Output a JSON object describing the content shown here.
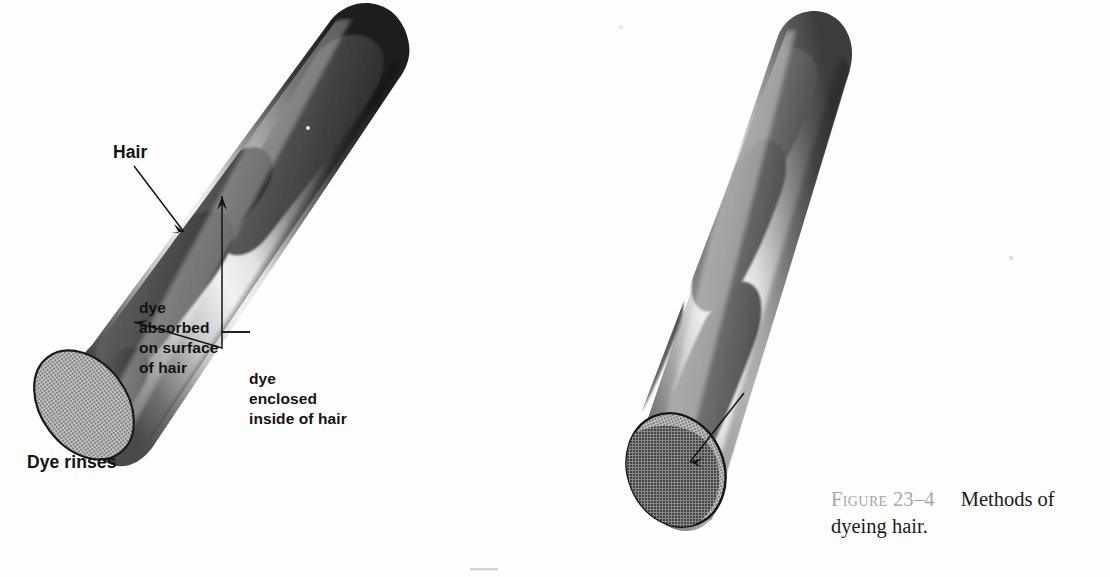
{
  "figure": {
    "caption_prefix": "Figure",
    "caption_number": "23–4",
    "caption_text": "Methods of dyeing hair.",
    "background_color": "#fdfdfd",
    "ink_color": "#131313",
    "caption_label_color": "#a8a8a8"
  },
  "labels": {
    "hair": "Hair",
    "dye_rinses": "Dye rinses",
    "dye_absorbed": "dye\nabsorbed\non surface\nof hair",
    "dye_enclosed": "dye\nenclosed\ninside of hair"
  },
  "diagram": {
    "type": "scientific-illustration",
    "panels": [
      {
        "name": "left-hair-shaft",
        "description": "Hair shaft cylinder with dye absorbed on outer surface",
        "label": "Dye rinses",
        "cut_end_fill": "#9d9d9d",
        "shaft_light": "#efefef",
        "shaft_dark": "#2e2e2e",
        "dye_patch_color": "#5a5a5a",
        "patch_count": 4
      },
      {
        "name": "right-hair-shaft",
        "description": "Hair shaft cylinder with dye enclosed inside the hair",
        "label": "dye enclosed inside of hair",
        "cut_end_fill": "#a7a7a7",
        "shaft_light": "#f2f2f2",
        "shaft_dark": "#434343",
        "dye_patch_color": "#6e6e6e",
        "patch_count": 4
      }
    ],
    "leaders": [
      {
        "name": "hair-leader",
        "from": "Hair",
        "to": "left shaft surface"
      },
      {
        "name": "dye-absorbed-bracket",
        "from": "dye absorbed on surface of hair",
        "to": "two dye patches on left shaft"
      },
      {
        "name": "dye-enclosed-leader",
        "from": "dye enclosed inside of hair",
        "to": "right shaft cut end"
      }
    ]
  }
}
